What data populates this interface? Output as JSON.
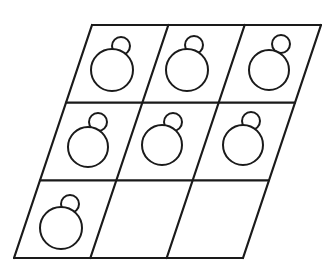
{
  "figure": {
    "stroke_color": "#1a1a1a",
    "background": "#ffffff",
    "grid": {
      "rows": 3,
      "cols": 3,
      "top_left": [
        92,
        25
      ],
      "top_right": [
        321,
        25
      ],
      "bottom_left": [
        14,
        258
      ],
      "bottom_right": [
        243,
        258
      ]
    },
    "cells": [
      {
        "row": 0,
        "col": 0,
        "filled": true,
        "big": [
          112,
          70,
          21
        ],
        "small": [
          121,
          46,
          9
        ]
      },
      {
        "row": 0,
        "col": 1,
        "filled": true,
        "big": [
          187,
          70,
          21
        ],
        "small": [
          194,
          45,
          9
        ]
      },
      {
        "row": 0,
        "col": 2,
        "filled": true,
        "big": [
          269,
          70,
          20
        ],
        "small": [
          281,
          44,
          9
        ]
      },
      {
        "row": 1,
        "col": 0,
        "filled": true,
        "big": [
          88,
          147,
          20
        ],
        "small": [
          98,
          122,
          9
        ]
      },
      {
        "row": 1,
        "col": 1,
        "filled": true,
        "big": [
          162,
          145,
          20
        ],
        "small": [
          173,
          122,
          9
        ]
      },
      {
        "row": 1,
        "col": 2,
        "filled": true,
        "big": [
          243,
          145,
          20
        ],
        "small": [
          251,
          121,
          9
        ]
      },
      {
        "row": 2,
        "col": 0,
        "filled": true,
        "big": [
          61,
          228,
          21
        ],
        "small": [
          70,
          204,
          9
        ]
      },
      {
        "row": 2,
        "col": 1,
        "filled": false
      },
      {
        "row": 2,
        "col": 2,
        "filled": false
      }
    ]
  }
}
